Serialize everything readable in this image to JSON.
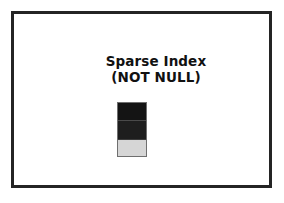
{
  "figure": {
    "frame": {
      "name": "slide-frame",
      "border_color": "#242424",
      "background_color": "#ffffff"
    },
    "caption": {
      "line1": "Sparse Index",
      "line2": "(NOT NULL)"
    },
    "index_column": {
      "label": "sparse-index-column",
      "segments": [
        {
          "name": "top",
          "fill": "#141414",
          "shade": "dark"
        },
        {
          "name": "middle",
          "fill": "#1e1e1e",
          "shade": "dark"
        },
        {
          "name": "bottom",
          "fill": "#d6d6d6",
          "shade": "light"
        }
      ]
    }
  }
}
